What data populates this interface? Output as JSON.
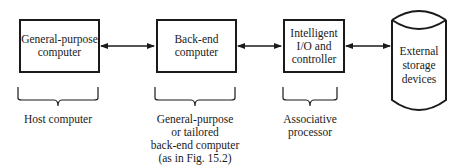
{
  "diagram": {
    "nodes": [
      {
        "id": "general-purpose-computer",
        "lines": [
          "General-purpose",
          "computer"
        ],
        "shape": "rectangle"
      },
      {
        "id": "back-end-computer",
        "lines": [
          "Back-end",
          "computer"
        ],
        "shape": "rectangle"
      },
      {
        "id": "intelligent-io-controller",
        "lines": [
          "Intelligent",
          "I/O and",
          "controller"
        ],
        "shape": "rectangle"
      },
      {
        "id": "external-storage-devices",
        "lines": [
          "External",
          "storage",
          "devices"
        ],
        "shape": "cylinder"
      }
    ],
    "edges": [
      {
        "from": "general-purpose-computer",
        "to": "back-end-computer",
        "type": "bidirectional-arrow"
      },
      {
        "from": "back-end-computer",
        "to": "intelligent-io-controller",
        "type": "bidirectional-arrow"
      },
      {
        "from": "intelligent-io-controller",
        "to": "external-storage-devices",
        "type": "bidirectional-arrow"
      }
    ],
    "braces": [
      {
        "under": "general-purpose-computer",
        "lines": [
          "Host computer"
        ]
      },
      {
        "under": "back-end-computer",
        "lines": [
          "General-purpose",
          "or tailored",
          "back-end computer",
          "(as in Fig. 15.2)"
        ]
      },
      {
        "under": "intelligent-io-controller",
        "lines": [
          "Associative",
          "processor"
        ]
      }
    ]
  }
}
